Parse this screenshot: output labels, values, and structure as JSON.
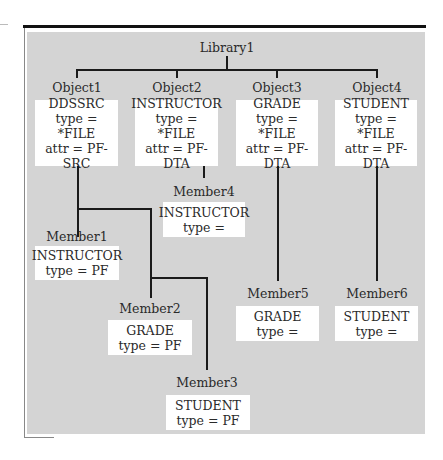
{
  "diagram": {
    "root": {
      "label": "Library1"
    },
    "objects": [
      {
        "label": "Object1",
        "name": "DDSSRC",
        "type": "type = *FILE",
        "attr": "attr = PF-SRC"
      },
      {
        "label": "Object2",
        "name": "INSTRUCTOR",
        "type": "type = *FILE",
        "attr": "attr = PF-DTA"
      },
      {
        "label": "Object3",
        "name": "GRADE",
        "type": "type = *FILE",
        "attr": "attr = PF-DTA"
      },
      {
        "label": "Object4",
        "name": "STUDENT",
        "type": "type = *FILE",
        "attr": "attr = PF-DTA"
      }
    ],
    "members": [
      {
        "label": "Member1",
        "name": "INSTRUCTOR",
        "type": "type = PF",
        "parent": "Object1"
      },
      {
        "label": "Member2",
        "name": "GRADE",
        "type": "type = PF",
        "parent": "Object1"
      },
      {
        "label": "Member3",
        "name": "STUDENT",
        "type": "type = PF",
        "parent": "Object1"
      },
      {
        "label": "Member4",
        "name": "INSTRUCTOR",
        "type": "type =",
        "parent": "Object2"
      },
      {
        "label": "Member5",
        "name": "GRADE",
        "type": "type =",
        "parent": "Object3"
      },
      {
        "label": "Member6",
        "name": "STUDENT",
        "type": "type =",
        "parent": "Object4"
      }
    ]
  },
  "colors": {
    "panel": "#d4d4d4",
    "box": "#ffffff",
    "line": "#1a1a1a",
    "topbar": "#111111"
  }
}
